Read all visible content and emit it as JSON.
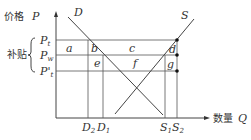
{
  "diagram": {
    "axes": {
      "y_label_cn": "价格",
      "y_label_var": "P",
      "x_label_cn": "数量",
      "x_label_var": "Q"
    },
    "bracket_label": "补贴",
    "price_levels": [
      {
        "id": "Pt",
        "main": "P",
        "sub": "t"
      },
      {
        "id": "Pw",
        "main": "P",
        "sub": "w"
      },
      {
        "id": "Pt_prime",
        "main": "P'",
        "sub": "t"
      }
    ],
    "quantity_levels": [
      {
        "id": "D2",
        "main": "D",
        "sub": "2"
      },
      {
        "id": "D1",
        "main": "D",
        "sub": "1"
      },
      {
        "id": "S1",
        "main": "S",
        "sub": "1"
      },
      {
        "id": "S2",
        "main": "S",
        "sub": "2"
      }
    ],
    "curves": {
      "demand": "D",
      "supply": "S"
    },
    "areas": [
      "a",
      "b",
      "c",
      "d",
      "e",
      "f",
      "g"
    ]
  }
}
